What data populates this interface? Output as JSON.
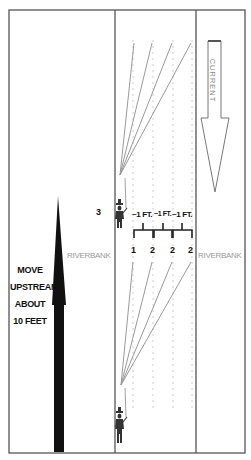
{
  "diagram": {
    "left_panel": {
      "instruction_lines": [
        "MOVE",
        "UPSTREAM",
        "ABOUT",
        "10 FEET"
      ],
      "step_number": "3",
      "bank_label": "RIVERBANK"
    },
    "river": {
      "spacing_labels": [
        "~1 FT.",
        "~1 FT.",
        "~1 FT."
      ],
      "cast_numbers": [
        "1",
        "2",
        "2",
        "2"
      ]
    },
    "right_panel": {
      "bank_label": "RIVERBANK",
      "current_label": "CURRENT"
    },
    "colors": {
      "frame": "#555555",
      "fan_lines": "#999999",
      "dotted_guides": "#cccccc",
      "bank_text": "#999999",
      "arrow": "#111111",
      "angler": "#333333"
    }
  }
}
